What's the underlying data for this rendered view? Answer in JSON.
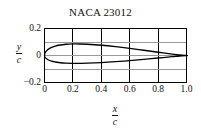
{
  "chart_data": {
    "type": "line",
    "title": "NACA 23012",
    "xlabel_numerator": "x",
    "xlabel_denominator": "c",
    "ylabel_numerator": "y",
    "ylabel_denominator": "c",
    "xlim": [
      0,
      1.0
    ],
    "ylim": [
      -0.2,
      0.2
    ],
    "xticks": [
      0,
      0.2,
      0.4,
      0.6,
      0.8,
      1.0
    ],
    "xtick_labels": [
      "0",
      "0.2",
      "0.4",
      "0.6",
      "0.8",
      "1.0"
    ],
    "yticks": [
      -0.2,
      0,
      0.2
    ],
    "ytick_labels": [
      "−0.2",
      "0",
      "0.2"
    ],
    "grid": true,
    "grid_x_values": [
      0.2,
      0.4,
      0.6,
      0.8
    ],
    "grid_y_values": [
      0.1,
      0,
      -0.1
    ],
    "legend": null,
    "line_color": "#000000",
    "grid_color": "#9a9a9a",
    "frame_color": "#000000",
    "background_color": "#ffffff",
    "series": [
      {
        "name": "NACA 23012 upper surface",
        "x": [
          0.0,
          0.0025,
          0.005,
          0.0125,
          0.025,
          0.05,
          0.075,
          0.1,
          0.15,
          0.2,
          0.25,
          0.3,
          0.4,
          0.5,
          0.6,
          0.7,
          0.8,
          0.9,
          0.95,
          1.0
        ],
        "y": [
          0.0,
          0.0154,
          0.0212,
          0.0327,
          0.0455,
          0.0601,
          0.0694,
          0.0758,
          0.0833,
          0.0859,
          0.0855,
          0.0834,
          0.0759,
          0.0654,
          0.0527,
          0.0387,
          0.0241,
          0.0102,
          0.0042,
          0.0
        ]
      },
      {
        "name": "NACA 23012 lower surface",
        "x": [
          0.0,
          0.0025,
          0.005,
          0.0125,
          0.025,
          0.05,
          0.075,
          0.1,
          0.15,
          0.2,
          0.25,
          0.3,
          0.4,
          0.5,
          0.6,
          0.7,
          0.8,
          0.9,
          0.95,
          1.0
        ],
        "y": [
          0.0,
          -0.0114,
          -0.0152,
          -0.0227,
          -0.0315,
          -0.0415,
          -0.0477,
          -0.052,
          -0.0569,
          -0.0582,
          -0.058,
          -0.0569,
          -0.0524,
          -0.0459,
          -0.0378,
          -0.0286,
          -0.0188,
          -0.0088,
          -0.0038,
          0.0
        ]
      }
    ]
  }
}
